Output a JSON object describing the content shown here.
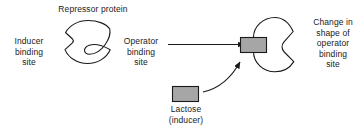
{
  "diagram": {
    "title_label": "Repressor protein",
    "left_shape": {
      "name": "repressor-protein-unbound",
      "inducer_site_label": "Inducer\nbinding\nsite",
      "operator_site_label": "Operator\nbinding\nsite",
      "fill": "#ffffff",
      "stroke": "#1a1a1a"
    },
    "right_shape": {
      "name": "repressor-protein-bound",
      "change_label": "Change in\nshape of\noperator\nbinding\nsite",
      "fill": "#ffffff",
      "stroke": "#1a1a1a"
    },
    "inducer": {
      "label": "Lactose\n(inducer)",
      "box_fill": "#a6a6a6",
      "box_stroke": "#1a1a1a"
    },
    "bound_inducer_box": {
      "name": "bound-lactose-box",
      "fill": "#a6a6a6",
      "stroke": "#1a1a1a"
    },
    "arrows": {
      "transition_arrow": "straight-right",
      "binding_arrow": "curved-up-right",
      "stroke": "#1a1a1a"
    }
  }
}
